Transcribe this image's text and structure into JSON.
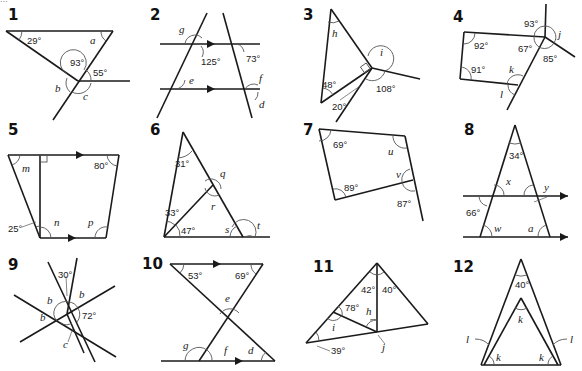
{
  "page": {
    "top_fragment": "..."
  },
  "problems": [
    {
      "number": "1",
      "labels": {
        "a1": "29°",
        "a2": "93°",
        "a3": "55°",
        "v1": "a",
        "v2": "b",
        "v3": "c"
      }
    },
    {
      "number": "2",
      "labels": {
        "a1": "125°",
        "a2": "73°",
        "v1": "g",
        "v2": "e",
        "v3": "f",
        "v4": "d"
      }
    },
    {
      "number": "3",
      "labels": {
        "a1": "48°",
        "a2": "20°",
        "a3": "108°",
        "v1": "h",
        "v2": "i"
      }
    },
    {
      "number": "4",
      "labels": {
        "a1": "93°",
        "a2": "92°",
        "a3": "67°",
        "a4": "91°",
        "a5": "85°",
        "v1": "j",
        "v2": "k",
        "v3": "l"
      }
    },
    {
      "number": "5",
      "labels": {
        "a1": "80°",
        "a2": "25°",
        "v1": "m",
        "v2": "n",
        "v3": "p"
      }
    },
    {
      "number": "6",
      "labels": {
        "a1": "31°",
        "a2": "33°",
        "a3": "47°",
        "v1": "q",
        "v2": "r",
        "v3": "s",
        "v4": "t"
      }
    },
    {
      "number": "7",
      "labels": {
        "a1": "69°",
        "a2": "89°",
        "a3": "87°",
        "v1": "u",
        "v2": "v"
      }
    },
    {
      "number": "8",
      "labels": {
        "a1": "34°",
        "a2": "66°",
        "v1": "x",
        "v2": "y",
        "v3": "w",
        "v4": "a"
      }
    },
    {
      "number": "9",
      "labels": {
        "a1": "30°",
        "a2": "72°",
        "v1": "b",
        "v2": "b",
        "v3": "b",
        "v4": "c"
      }
    },
    {
      "number": "10",
      "labels": {
        "a1": "53°",
        "a2": "69°",
        "v1": "e",
        "v2": "g",
        "v3": "f",
        "v4": "d"
      }
    },
    {
      "number": "11",
      "labels": {
        "a1": "42°",
        "a2": "40°",
        "a3": "78°",
        "a4": "39°",
        "v1": "i",
        "v2": "h",
        "v3": "j"
      }
    },
    {
      "number": "12",
      "labels": {
        "a1": "40°",
        "v1": "k",
        "v2": "l",
        "v3": "l",
        "v4": "k",
        "v5": "k"
      }
    }
  ]
}
